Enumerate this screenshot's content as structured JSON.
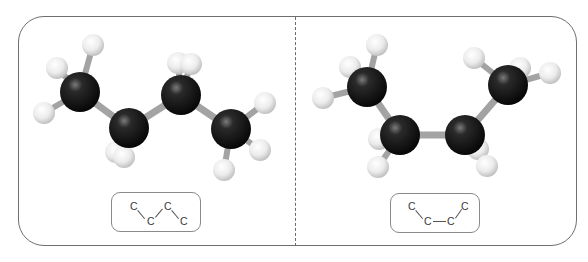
{
  "figure": {
    "panels": [
      {
        "name": "anti-conformation",
        "formula": {
          "atoms": [
            "C",
            "C",
            "C",
            "C"
          ],
          "layout": "zigzag"
        },
        "carbons": [
          [
            80,
            92
          ],
          [
            129,
            128
          ],
          [
            181,
            95
          ],
          [
            231,
            129
          ]
        ],
        "hydrogens": [
          [
            93,
            45
          ],
          [
            57,
            68
          ],
          [
            44,
            113
          ],
          [
            116,
            152
          ],
          [
            124,
            157
          ],
          [
            178,
            63
          ],
          [
            191,
            64
          ],
          [
            265,
            103
          ],
          [
            260,
            150
          ],
          [
            224,
            170
          ]
        ]
      },
      {
        "name": "gauche-conformation",
        "formula": {
          "atoms": [
            "C",
            "C",
            "C",
            "C"
          ],
          "layout": "u-shape",
          "bond": "—"
        },
        "carbons": [
          [
            367,
            87
          ],
          [
            400,
            135
          ],
          [
            465,
            135
          ],
          [
            508,
            85
          ]
        ],
        "hydrogens": [
          [
            377,
            45
          ],
          [
            350,
            67
          ],
          [
            323,
            98
          ],
          [
            379,
            139
          ],
          [
            378,
            167
          ],
          [
            478,
            149
          ],
          [
            487,
            166
          ],
          [
            474,
            58
          ],
          [
            520,
            68
          ],
          [
            550,
            73
          ]
        ]
      }
    ],
    "colors": {
      "frame": "#6f6f6f",
      "carbon": "#151515",
      "hydrogen": "#e9e9e9",
      "bond": "#a3a3a3",
      "formula_text": "#3a3a3a"
    }
  },
  "labels": {
    "left_formula": {
      "c1": "C",
      "c2": "C",
      "c3": "C",
      "c4": "C"
    },
    "right_formula": {
      "c1": "C",
      "c2": "C",
      "c3": "C",
      "c4": "C",
      "dash": "—"
    }
  }
}
